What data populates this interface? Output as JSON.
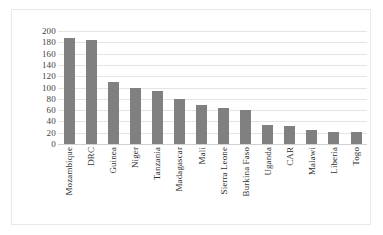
{
  "chart_data": {
    "type": "bar",
    "title": "",
    "subtitle": "",
    "xlabel": "",
    "ylabel": "",
    "ylim": [
      0,
      200
    ],
    "yticks": [
      200,
      180,
      160,
      140,
      120,
      100,
      80,
      60,
      40,
      20,
      0
    ],
    "grid": true,
    "legend": false,
    "legend_position": "none",
    "bar_color": "#808080",
    "gridline_color": "#e4e4e4",
    "border_color": "#e9e9e9",
    "categories": [
      "Mozambique",
      "DRC",
      "Guinea",
      "Niger",
      "Tanzania",
      "Madagascar",
      "Mali",
      "Sierra Leone",
      "Burkina Faso",
      "Uganda",
      "CAR",
      "Malawi",
      "Liberia",
      "Togo"
    ],
    "values": [
      187,
      184,
      110,
      99,
      94,
      79,
      69,
      63,
      61,
      33,
      32,
      24,
      22,
      21
    ]
  }
}
